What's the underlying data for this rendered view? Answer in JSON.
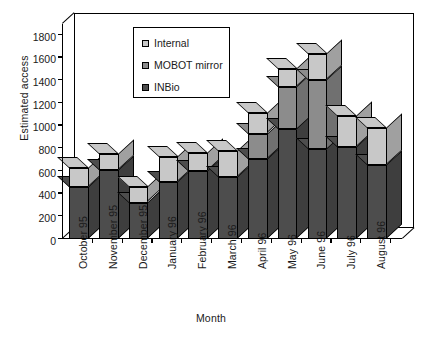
{
  "chart_data": {
    "type": "bar",
    "subtype": "stacked-column-3d",
    "title": "",
    "xlabel": "Month",
    "ylabel": "Estimated access",
    "ylim": [
      0,
      1800
    ],
    "yticks": [
      0,
      200,
      400,
      600,
      800,
      1000,
      1200,
      1400,
      1600,
      1800
    ],
    "grid": false,
    "legend_position": "top-center-inside",
    "categories": [
      "October 95",
      "November 95",
      "December 95",
      "January 96",
      "February 96",
      "March 96",
      "April 96",
      "May 96",
      "June 96",
      "July 96",
      "August 96"
    ],
    "series": [
      {
        "name": "INBio",
        "color": "#4d4d4d",
        "values": [
          455,
          610,
          320,
          500,
          600,
          545,
          710,
          970,
          790,
          815,
          650
        ]
      },
      {
        "name": "MOBOT mirror",
        "color": "#8c8c8c",
        "values": [
          0,
          0,
          0,
          0,
          0,
          0,
          220,
          375,
          615,
          0,
          0
        ]
      },
      {
        "name": "Internal",
        "color": "#c8c8c8",
        "values": [
          170,
          140,
          135,
          220,
          155,
          230,
          180,
          155,
          225,
          270,
          330
        ]
      }
    ],
    "totals": [
      625,
      750,
      455,
      720,
      755,
      775,
      1110,
      1500,
      1630,
      1085,
      980
    ]
  },
  "legend": {
    "items": [
      {
        "label": "Internal",
        "color": "#c8c8c8"
      },
      {
        "label": "MOBOT mirror",
        "color": "#8c8c8c"
      },
      {
        "label": "INBio",
        "color": "#4d4d4d"
      }
    ]
  }
}
